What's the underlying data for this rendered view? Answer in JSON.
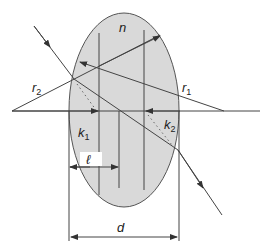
{
  "diagram": {
    "type": "thick-lens-optics",
    "labels": {
      "n": "n",
      "r1": "r",
      "r1_sub": "1",
      "r2": "r",
      "r2_sub": "2",
      "k1": "k",
      "k1_sub": "1",
      "k2": "k",
      "k2_sub": "2",
      "l": "ℓ",
      "d": "d"
    },
    "colors": {
      "lens_fill": "#d9d9d9",
      "line": "#444444",
      "background": "#ffffff"
    }
  }
}
